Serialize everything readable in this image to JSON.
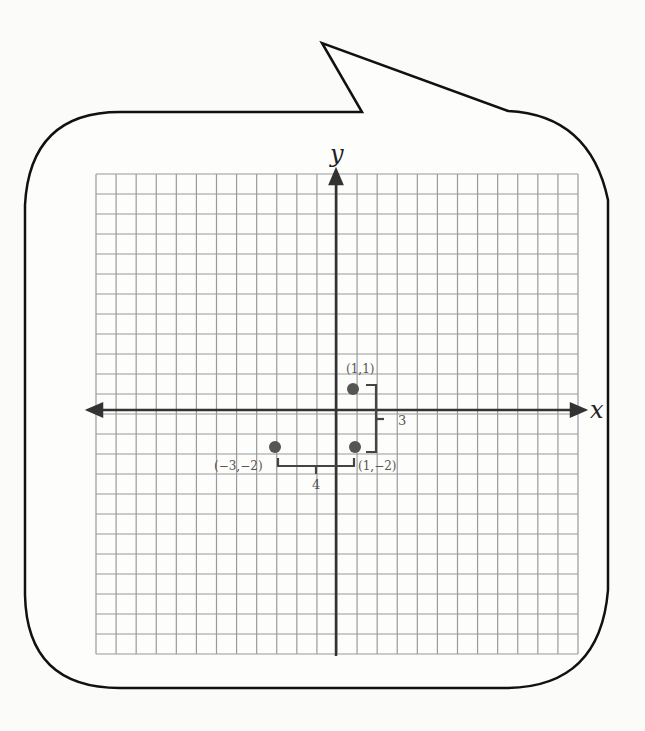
{
  "diagram": {
    "type": "coordinate-plane-speech-bubble",
    "axes": {
      "x_label": "x",
      "y_label": "y"
    },
    "grid": {
      "columns": 24,
      "rows": 24,
      "origin_col": 12,
      "origin_row": 12
    },
    "points": [
      {
        "label": "(1,1)",
        "x": 1,
        "y": 1
      },
      {
        "label": "(1,−2)",
        "x": 1,
        "y": -2
      },
      {
        "label": "(−3,−2)",
        "x": -3,
        "y": -2
      }
    ],
    "distances": [
      {
        "label": "3",
        "between": [
          "(1,1)",
          "(1,−2)"
        ],
        "orientation": "vertical"
      },
      {
        "label": "4",
        "between": [
          "(−3,−2)",
          "(1,−2)"
        ],
        "orientation": "horizontal"
      }
    ],
    "colors": {
      "grid": "#9a9a9a",
      "axis": "#333333",
      "point": "#555555",
      "bubble": "#111111"
    }
  }
}
